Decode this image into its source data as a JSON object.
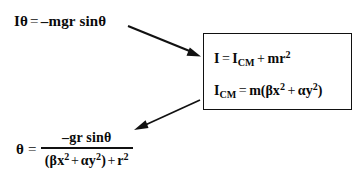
{
  "figure": {
    "background_color": "#ffffff",
    "text_color": "#0a0a0a"
  },
  "equations": {
    "motion": {
      "name": "equation-of-motion",
      "lhs_symbol": "I",
      "lhs_angle": "θ",
      "relation": "=",
      "rhs": "–mgr sinθ",
      "full_text": "Iθ = –mgr sinθ"
    },
    "inertia": {
      "name": "parallel-axis-theorem",
      "lhs": "I",
      "relation": "=",
      "term1_base": "I",
      "term1_sub": "CM",
      "operator": "+",
      "term2_base": "mr",
      "term2_sup": "2",
      "full_text": "I = I_CM + mr²"
    },
    "icm": {
      "name": "center-of-mass-moment-of-inertia",
      "lhs_base": "I",
      "lhs_sub": "CM",
      "relation": "=",
      "rhs_prefix": "m(",
      "term1_base": "βx",
      "term1_sup": "2",
      "operator": "+",
      "term2_base": "αy",
      "term2_sup": "2",
      "rhs_suffix": ")",
      "full_text": "I_CM = m(βx² + αy²)"
    },
    "result": {
      "name": "angular-acceleration-result",
      "lhs": "θ",
      "relation": "=",
      "numerator": "–gr sinθ",
      "denominator_prefix": "(",
      "den_term1_base": "βx",
      "den_term1_sup": "2",
      "den_operator1": "+",
      "den_term2_base": "αy",
      "den_term2_sup": "2",
      "denominator_middle": ")",
      "den_operator2": "+",
      "den_term3_base": "r",
      "den_term3_sup": "2",
      "full_text": "θ = –gr sinθ / ((βx² + αy²) + r²)"
    }
  },
  "box": {
    "name": "substitution-box",
    "border_color": "#111111",
    "fill_color": "#ffffff"
  },
  "arrows": [
    {
      "name": "arrow-motion-to-box",
      "direction": "down-right",
      "from": "equation-of-motion",
      "to": "substitution-box",
      "color": "#111111"
    },
    {
      "name": "arrow-box-to-result",
      "direction": "down-left",
      "from": "substitution-box",
      "to": "angular-acceleration-result",
      "color": "#111111"
    }
  ]
}
